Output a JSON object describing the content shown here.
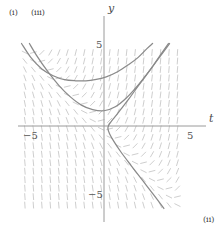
{
  "figure": {
    "kind": "slope-field-with-solution-curves",
    "background_color": "#ffffff",
    "field_color": "#c8c8c8",
    "curve_color": "#8a8a8a",
    "axis_color": "#9a9a9a",
    "text_color": "#4a4a4a"
  },
  "axes": {
    "x_label": "t",
    "y_label": "y",
    "x_tick_negative": "−5",
    "x_tick_positive": "5",
    "y_tick_positive": "5",
    "y_tick_negative": "−5",
    "xlim": [
      -7.3,
      7.3
    ],
    "ylim": [
      -7.3,
      7.3
    ],
    "origin_px": [
      104,
      126
    ],
    "px_per_unit": 11.3,
    "grid": false,
    "tick_values_x": [
      -5,
      5
    ],
    "tick_values_y": [
      -5,
      5
    ]
  },
  "curve_labels": {
    "i": "(i)",
    "ii": "(ii)",
    "iii": "(iii)"
  },
  "chart_data": {
    "type": "line",
    "title": "",
    "xlabel": "t",
    "ylabel": "y",
    "xlim": [
      -7.3,
      7.3
    ],
    "ylim": [
      -7.3,
      7.3
    ],
    "grid": false,
    "legend": "inline-labels",
    "field": {
      "type": "slope-field",
      "slope_expression": "dy/dt = t + y",
      "t_range": [
        -7,
        7
      ],
      "y_range": [
        -7,
        7
      ],
      "step": 0.75,
      "segment_length_px": 6
    },
    "series": [
      {
        "name": "(i)",
        "label_position": "top-left",
        "description": "upper solution branch entering from top-left, minimum near y=4.2, rising to upper right",
        "points": [
          [
            -7.3,
            7.3
          ],
          [
            -6.5,
            6.1
          ],
          [
            -5.5,
            5.05
          ],
          [
            -4.5,
            4.45
          ],
          [
            -3.5,
            4.1
          ],
          [
            -2.5,
            4.0
          ],
          [
            -1.6,
            4.0
          ],
          [
            -0.8,
            4.1
          ],
          [
            0.2,
            4.35
          ],
          [
            1.2,
            4.8
          ],
          [
            2.2,
            5.45
          ],
          [
            3.0,
            6.05
          ],
          [
            3.8,
            6.85
          ],
          [
            4.3,
            7.3
          ]
        ]
      },
      {
        "name": "(iii)",
        "label_position": "top-left-inner",
        "description": "lower hyperbolic branch from top-left, minimum near y=1.35 at t=0, rising steeply to upper right along asymptote",
        "points": [
          [
            -6.6,
            7.3
          ],
          [
            -6.0,
            6.3
          ],
          [
            -5.0,
            4.85
          ],
          [
            -4.0,
            3.6
          ],
          [
            -3.0,
            2.6
          ],
          [
            -2.0,
            1.85
          ],
          [
            -1.0,
            1.45
          ],
          [
            0.0,
            1.35
          ],
          [
            1.0,
            1.7
          ],
          [
            2.0,
            2.5
          ],
          [
            3.0,
            3.6
          ],
          [
            4.0,
            4.85
          ],
          [
            5.0,
            6.3
          ],
          [
            5.7,
            7.3
          ]
        ]
      },
      {
        "name": "(ii)",
        "label_position": "bottom-right",
        "description": "separatrix branch: comes down from upper right, turns at t≈0.35 just above the t-axis, then descends to lower right",
        "points": [
          [
            5.8,
            7.3
          ],
          [
            5.0,
            6.2
          ],
          [
            4.0,
            4.85
          ],
          [
            3.0,
            3.5
          ],
          [
            2.2,
            2.4
          ],
          [
            1.5,
            1.5
          ],
          [
            1.0,
            0.85
          ],
          [
            0.6,
            0.35
          ],
          [
            0.4,
            0.05
          ],
          [
            0.35,
            -0.25
          ],
          [
            0.5,
            -0.7
          ],
          [
            0.9,
            -1.4
          ],
          [
            1.5,
            -2.3
          ],
          [
            2.4,
            -3.5
          ],
          [
            3.4,
            -4.8
          ],
          [
            4.4,
            -6.1
          ],
          [
            5.3,
            -7.3
          ]
        ]
      }
    ]
  }
}
